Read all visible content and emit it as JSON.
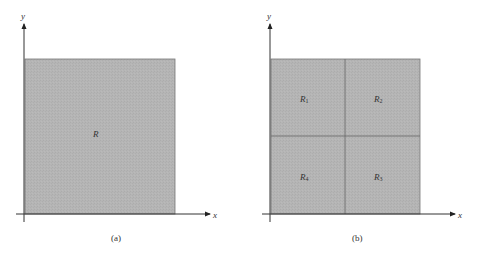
{
  "figure": {
    "fill_color": "#b3b3b3",
    "line_color": "#555555",
    "axis_color": "#333333",
    "panels": [
      {
        "id": "a",
        "caption": "(a)",
        "axis_x_label": "x",
        "axis_y_label": "y",
        "regions": [
          {
            "label": "R",
            "subscript": ""
          }
        ]
      },
      {
        "id": "b",
        "caption": "(b)",
        "axis_x_label": "x",
        "axis_y_label": "y",
        "regions": [
          {
            "label": "R",
            "subscript": "1",
            "position": "top-left"
          },
          {
            "label": "R",
            "subscript": "2",
            "position": "top-right"
          },
          {
            "label": "R",
            "subscript": "4",
            "position": "bottom-left"
          },
          {
            "label": "R",
            "subscript": "3",
            "position": "bottom-right"
          }
        ]
      }
    ]
  }
}
